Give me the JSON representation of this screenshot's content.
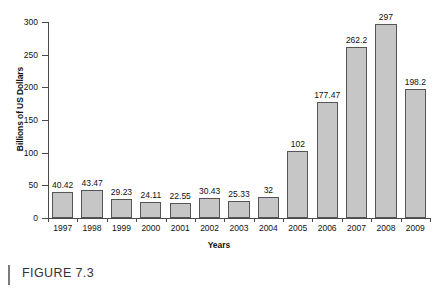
{
  "chart_data": {
    "type": "bar",
    "title": "",
    "xlabel": "Years",
    "ylabel": "Billions of US Dollars",
    "ylim": [
      0,
      300
    ],
    "yticks": [
      0,
      50,
      100,
      150,
      200,
      250,
      300
    ],
    "grid": false,
    "legend": "none",
    "bar_color": "#c6c6c6",
    "bar_edge_color": "#555555",
    "categories": [
      "1997",
      "1998",
      "1999",
      "2000",
      "2001",
      "2002",
      "2003",
      "2004",
      "2005",
      "2006",
      "2007",
      "2008",
      "2009"
    ],
    "values": [
      40.42,
      43.47,
      29.23,
      24.11,
      22.55,
      30.43,
      25.33,
      32,
      102,
      177.47,
      262.2,
      297,
      198.2
    ],
    "value_labels": [
      "40.42",
      "43.47",
      "29.23",
      "24.11",
      "22.55",
      "30.43",
      "25.33",
      "32",
      "102",
      "177.47",
      "262.2",
      "297",
      "198.2"
    ]
  },
  "caption": {
    "text": "FIGURE 7.3"
  }
}
